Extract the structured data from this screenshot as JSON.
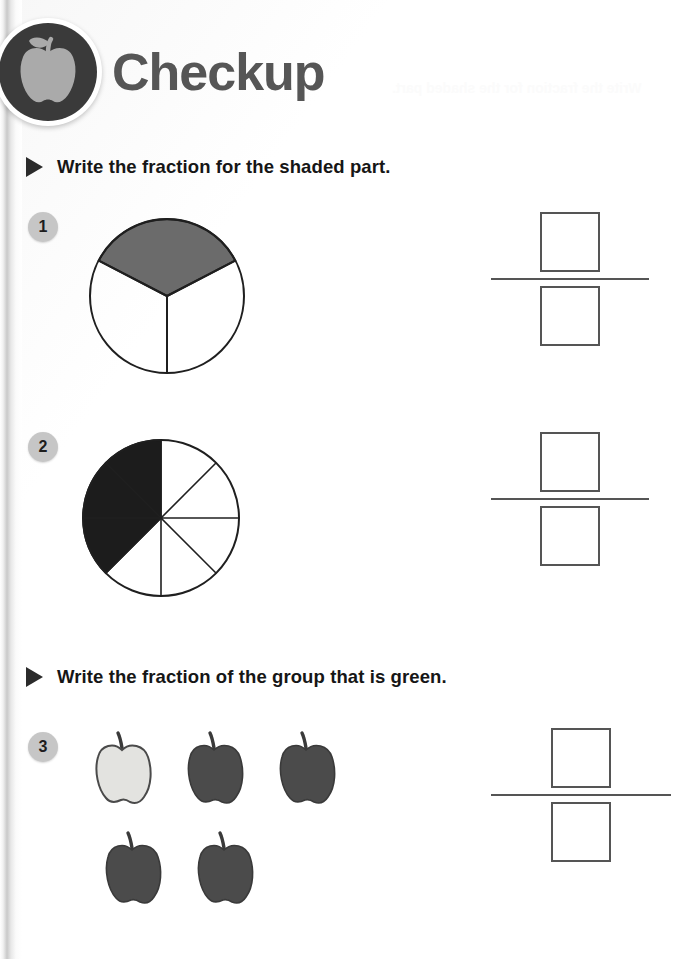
{
  "page": {
    "title": "Checkup",
    "logo_icon": "apple-icon",
    "ghost_text": "Write the fraction for the shaded part."
  },
  "sections": [
    {
      "id": "section-shaded",
      "bullet_icon": "triangle-bullet-icon",
      "instruction": "Write the fraction for the shaded part.",
      "questions": [
        {
          "number": "1",
          "figure": "circle-thirds-one-shaded",
          "parts_total": 3,
          "parts_shaded": 1,
          "shade_color": "#6b6b6b",
          "answer": {
            "numerator": "",
            "denominator": ""
          }
        },
        {
          "number": "2",
          "figure": "circle-eighths-three-shaded",
          "parts_total": 8,
          "parts_shaded": 3,
          "shade_color": "#1c1c1c",
          "answer": {
            "numerator": "",
            "denominator": ""
          }
        }
      ]
    },
    {
      "id": "section-group",
      "bullet_icon": "triangle-bullet-icon",
      "instruction": "Write the fraction of the group that is green.",
      "questions": [
        {
          "number": "3",
          "figure": "apple-group",
          "apples": [
            {
              "color_name": "green",
              "fill": "#e3e3e0"
            },
            {
              "color_name": "red",
              "fill": "#4b4b4b"
            },
            {
              "color_name": "red",
              "fill": "#4b4b4b"
            },
            {
              "color_name": "red",
              "fill": "#4b4b4b"
            },
            {
              "color_name": "red",
              "fill": "#4b4b4b"
            }
          ],
          "group_total": 5,
          "green_count": 1,
          "answer": {
            "numerator": "",
            "denominator": ""
          }
        }
      ]
    }
  ],
  "colors": {
    "title": "#565656",
    "badge_disc": "#3a3a3a",
    "badge_apple": "#aaaaaa",
    "qnum_bg": "#c6c6c6",
    "outline": "#2b2b2b",
    "box_border": "#555555"
  }
}
